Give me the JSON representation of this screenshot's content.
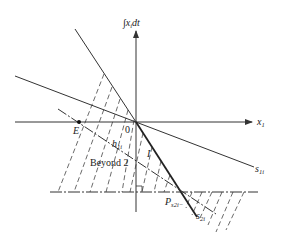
{
  "diagram": {
    "y_axis_label": "∫x",
    "y_axis_label_sub": "i",
    "y_axis_label_tail": "dt",
    "x_axis_label": "x",
    "x_axis_label_sub": "1",
    "origin_label": "0",
    "point_E_label": "E",
    "h_label": "h",
    "h_label_sub": "1i",
    "region_I_label": "I",
    "region_beyond_label": "Beyond 2",
    "s1_label": "s",
    "s1_label_sub": "1i",
    "s2_label": "s",
    "s2_label_sub": "2i",
    "p_label": "P",
    "p_label_sub": "s2i−"
  },
  "colors": {
    "line": "#333333",
    "background": "#ffffff"
  }
}
